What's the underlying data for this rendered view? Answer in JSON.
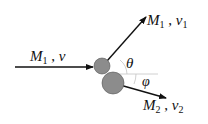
{
  "diagram": {
    "type": "collision",
    "incoming": {
      "mass": "M",
      "mass_sub": "1",
      "sep": " , ",
      "velocity": "v",
      "velocity_sub": ""
    },
    "outgoing_1": {
      "mass": "M",
      "mass_sub": "1",
      "sep": " , ",
      "velocity": "v",
      "velocity_sub": "1"
    },
    "outgoing_2": {
      "mass": "M",
      "mass_sub": "2",
      "sep": " , ",
      "velocity": "v",
      "velocity_sub": "2"
    },
    "angle_1": "θ",
    "angle_2": "φ",
    "colors": {
      "ball": "#8c8c8c",
      "line": "#111111",
      "ref_line": "#bbbbbb",
      "arc": "#bbbbbb"
    }
  }
}
